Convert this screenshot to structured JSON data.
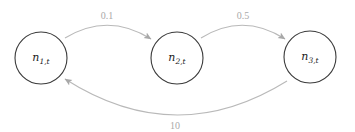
{
  "diagram": {
    "type": "directed-graph",
    "nodes": [
      {
        "id": "n1",
        "base": "n",
        "subscript": "1,t",
        "cx": 41,
        "cy": 58,
        "r": 26
      },
      {
        "id": "n2",
        "base": "n",
        "subscript": "2,t",
        "cx": 177,
        "cy": 58,
        "r": 26
      },
      {
        "id": "n3",
        "base": "n",
        "subscript": "3,t",
        "cx": 310,
        "cy": 57,
        "r": 26
      }
    ],
    "edges": [
      {
        "from": "n1",
        "to": "n2",
        "label": "0.1",
        "label_x": 107,
        "label_y": 15
      },
      {
        "from": "n2",
        "to": "n3",
        "label": "0.5",
        "label_x": 243,
        "label_y": 15
      },
      {
        "from": "n3",
        "to": "n1",
        "label": "10",
        "label_x": 175,
        "label_y": 125
      }
    ],
    "colors": {
      "node_stroke": "#3a3a3a",
      "edge_stroke": "#b9b9b9",
      "edge_label": "#a9a9a9"
    }
  }
}
